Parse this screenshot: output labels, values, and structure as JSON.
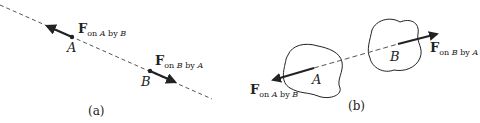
{
  "panel_a": {
    "caption": "(a)",
    "point_a_label": "A",
    "point_b_label": "B",
    "force_on_a": {
      "symbol": "F",
      "subscript_pre": "on ",
      "subscript_obj1": "A",
      "subscript_mid": " by ",
      "subscript_obj2": "B"
    },
    "force_on_b": {
      "symbol": "F",
      "subscript_pre": "on ",
      "subscript_obj1": "B",
      "subscript_mid": " by ",
      "subscript_obj2": "A"
    }
  },
  "panel_b": {
    "caption": "(b)",
    "body_a_label": "A",
    "body_b_label": "B",
    "force_on_a": {
      "symbol": "F",
      "subscript_pre": "on ",
      "subscript_obj1": "A",
      "subscript_mid": " by ",
      "subscript_obj2": "B"
    },
    "force_on_b": {
      "symbol": "F",
      "subscript_pre": "on ",
      "subscript_obj1": "B",
      "subscript_mid": " by ",
      "subscript_obj2": "A"
    }
  },
  "colors": {
    "ink": "#222222",
    "background": "#ffffff"
  }
}
